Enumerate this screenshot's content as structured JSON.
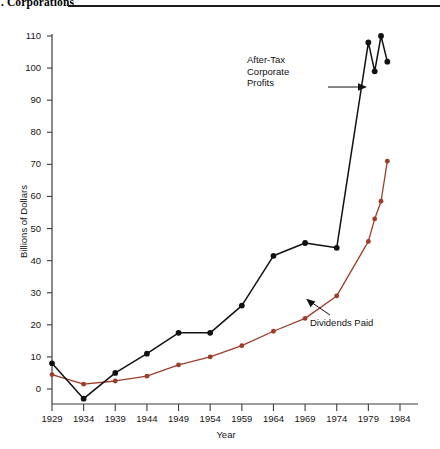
{
  "header": {
    "title": ". Corporations",
    "rule": "horizontal-rule"
  },
  "chart_data": {
    "type": "line",
    "title": ". Corporations",
    "xlabel": "Year",
    "ylabel": "Billions of Dollars",
    "xlim": [
      1929,
      1984
    ],
    "ylim": [
      -10,
      115
    ],
    "yticks": [
      0,
      10,
      20,
      30,
      40,
      50,
      60,
      70,
      80,
      90,
      100,
      110
    ],
    "ytick_labels": [
      "0",
      "10",
      "20",
      "30",
      "40",
      "50",
      "60",
      "70",
      "80",
      "90",
      "100",
      "110"
    ],
    "xticks": [
      1929,
      1934,
      1939,
      1944,
      1949,
      1954,
      1959,
      1964,
      1969,
      1974,
      1979,
      1984
    ],
    "xtick_labels": [
      "1929",
      "1934",
      "1939",
      "1944",
      "1949",
      "1954",
      "1959",
      "1964",
      "1969",
      "1974",
      "1979",
      "1984"
    ],
    "grid": false,
    "legend": "annotations-inline",
    "series": [
      {
        "name": "After-Tax Corporate Profits",
        "color": "#111111",
        "marker": "filled-circle",
        "x": [
          1929,
          1934,
          1939,
          1944,
          1949,
          1954,
          1959,
          1964,
          1969,
          1974,
          1979,
          1980,
          1981,
          1982
        ],
        "values": [
          8,
          -3,
          5,
          11,
          17.5,
          17.5,
          26,
          41.5,
          45.5,
          44,
          108,
          99,
          110,
          102
        ]
      },
      {
        "name": "Dividends Paid",
        "color": "#9e3c2a",
        "marker": "filled-circle",
        "x": [
          1929,
          1934,
          1939,
          1944,
          1949,
          1954,
          1959,
          1964,
          1969,
          1974,
          1979,
          1980,
          1981,
          1982
        ],
        "values": [
          4.5,
          1.5,
          2.5,
          4,
          7.5,
          10,
          13.5,
          18,
          22,
          29,
          46,
          53,
          58.5,
          71
        ]
      }
    ],
    "annotations": [
      {
        "text": "After-Tax\nCorporate\nProfits",
        "target_series": "After-Tax Corporate Profits"
      },
      {
        "text": "Dividends Paid",
        "target_series": "Dividends Paid"
      }
    ]
  },
  "colors": {
    "profits_line": "#111111",
    "dividends_line": "#9e3c2a",
    "axis": "#3d3d3d",
    "text": "#161616",
    "rule": "#1b1b1b"
  }
}
